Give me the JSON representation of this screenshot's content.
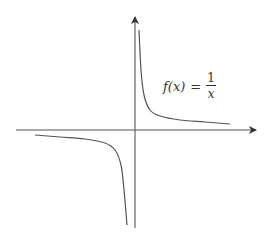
{
  "chart_data": {
    "type": "line",
    "title": "",
    "xlabel": "",
    "ylabel": "",
    "function": "f(x) = 1/x",
    "annotation": {
      "name": "f(x)",
      "equals": "=",
      "numerator": "1",
      "denominator": "x"
    },
    "grid": false,
    "legend": "none",
    "axes": {
      "origin_px": [
        135,
        130
      ],
      "x_axis_px": [
        16,
        256
      ],
      "y_axis_px": [
        17,
        228
      ],
      "arrows": [
        "x-positive",
        "y-positive"
      ]
    },
    "series": [
      {
        "name": "f(x) = 1/x, x > 0",
        "branch": "upper-right",
        "points_px": [
          [
            139,
            30
          ],
          [
            141,
            70
          ],
          [
            144,
            95
          ],
          [
            150,
            110
          ],
          [
            160,
            116
          ],
          [
            180,
            120
          ],
          [
            205,
            122
          ],
          [
            230,
            124
          ]
        ]
      },
      {
        "name": "f(x) = 1/x, x < 0",
        "branch": "lower-left",
        "points_px": [
          [
            35,
            135
          ],
          [
            60,
            137
          ],
          [
            85,
            139
          ],
          [
            105,
            143
          ],
          [
            115,
            150
          ],
          [
            121,
            165
          ],
          [
            124,
            190
          ],
          [
            127,
            225
          ]
        ]
      }
    ],
    "colors": {
      "axis": "#444444",
      "curve": "#555555",
      "text": "#333333"
    }
  }
}
